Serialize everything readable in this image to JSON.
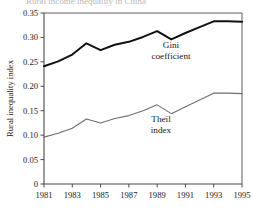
{
  "figure": {
    "cropped_title_fragment": "Rural income inequality in China"
  },
  "axes": {
    "y_title": "Rural inequality index",
    "y_ticks": [
      "0",
      "0.05",
      "0.10",
      "0.15",
      "0.20",
      "0.25",
      "0.30",
      "0.35"
    ],
    "x_ticks": [
      "1981",
      "1983",
      "1985",
      "1987",
      "1989",
      "1991",
      "1993",
      "1995"
    ]
  },
  "annotations": {
    "gini_line1": "Gini",
    "gini_line2": "coefficient",
    "theil_line1": "Theil",
    "theil_line2": "index"
  },
  "colors": {
    "gini": "#111111",
    "theil": "#6e6e6e",
    "axis": "#4a4a4a",
    "background": "#ffffff"
  },
  "chart_data": {
    "type": "line",
    "title": "",
    "xlabel": "",
    "ylabel": "Rural inequality index",
    "xlim": [
      1981,
      1995
    ],
    "ylim": [
      0,
      0.35
    ],
    "grid": false,
    "legend_position": "inline-annotations",
    "x": [
      1981,
      1982,
      1983,
      1984,
      1985,
      1986,
      1987,
      1988,
      1989,
      1990,
      1991,
      1992,
      1993,
      1994,
      1995
    ],
    "series": [
      {
        "name": "Gini coefficient",
        "color": "#111111",
        "values": [
          0.241,
          0.251,
          0.265,
          0.288,
          0.274,
          0.285,
          0.291,
          0.301,
          0.313,
          0.296,
          0.309,
          0.321,
          0.333,
          0.333,
          0.332
        ]
      },
      {
        "name": "Theil index",
        "color": "#6e6e6e",
        "values": [
          0.096,
          0.104,
          0.114,
          0.133,
          0.125,
          0.134,
          0.14,
          0.15,
          0.162,
          0.144,
          0.158,
          0.172,
          0.186,
          0.186,
          0.185
        ]
      }
    ]
  }
}
